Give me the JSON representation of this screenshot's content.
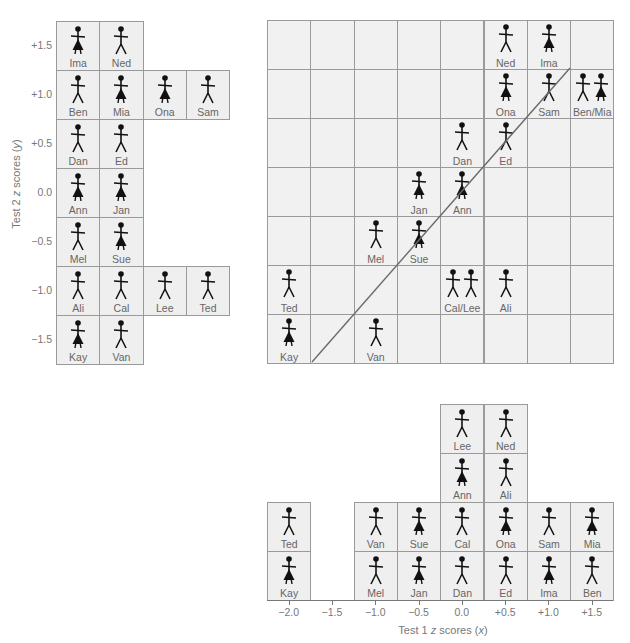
{
  "figure_shapes": {
    "male": "stick-figure-male",
    "female": "stick-figure-female-skirt"
  },
  "people": {
    "Ima": {
      "sex": "F",
      "x": 1.0,
      "y": 1.5
    },
    "Ned": {
      "sex": "M",
      "x": 0.5,
      "y": 1.5
    },
    "Ben": {
      "sex": "M",
      "x": 1.5,
      "y": 1.0
    },
    "Mia": {
      "sex": "F",
      "x": 1.5,
      "y": 1.0
    },
    "Ona": {
      "sex": "F",
      "x": 0.5,
      "y": 1.0
    },
    "Sam": {
      "sex": "M",
      "x": 1.0,
      "y": 1.0
    },
    "Dan": {
      "sex": "M",
      "x": 0.0,
      "y": 0.5
    },
    "Ed": {
      "sex": "M",
      "x": 0.5,
      "y": 0.5
    },
    "Ann": {
      "sex": "F",
      "x": 0.0,
      "y": 0.0
    },
    "Jan": {
      "sex": "F",
      "x": -0.5,
      "y": 0.0
    },
    "Mel": {
      "sex": "M",
      "x": -1.0,
      "y": -0.5
    },
    "Sue": {
      "sex": "F",
      "x": -0.5,
      "y": -0.5
    },
    "Ali": {
      "sex": "M",
      "x": 0.5,
      "y": -1.0
    },
    "Cal": {
      "sex": "M",
      "x": 0.0,
      "y": -1.0
    },
    "Lee": {
      "sex": "M",
      "x": 0.0,
      "y": -1.0
    },
    "Ted": {
      "sex": "M",
      "x": -2.0,
      "y": -1.0
    },
    "Kay": {
      "sex": "F",
      "x": -2.0,
      "y": -1.5
    },
    "Van": {
      "sex": "M",
      "x": -1.0,
      "y": -1.5
    }
  },
  "chart_data": [
    {
      "type": "histogram-pictograph",
      "title": "",
      "orientation": "horizontal",
      "ylabel": "Test 2 z scores (y)",
      "categories": [
        "+1.5",
        "+1.0",
        "+0.5",
        "0.0",
        "-0.5",
        "-1.0",
        "-1.5"
      ],
      "rows": [
        {
          "y": "+1.5",
          "names": [
            "Ima",
            "Ned"
          ]
        },
        {
          "y": "+1.0",
          "names": [
            "Ben",
            "Mia",
            "Ona",
            "Sam"
          ]
        },
        {
          "y": "+0.5",
          "names": [
            "Dan",
            "Ed"
          ]
        },
        {
          "y": "0.0",
          "names": [
            "Ann",
            "Jan"
          ]
        },
        {
          "y": "-0.5",
          "names": [
            "Mel",
            "Sue"
          ]
        },
        {
          "y": "-1.0",
          "names": [
            "Ali",
            "Cal",
            "Lee",
            "Ted"
          ]
        },
        {
          "y": "-1.5",
          "names": [
            "Kay",
            "Van"
          ]
        }
      ],
      "values": [
        2,
        4,
        2,
        2,
        2,
        4,
        2
      ]
    },
    {
      "type": "scatter",
      "title": "",
      "xlabel": "Test 1 z scores (x)",
      "ylabel": "Test 2 z scores (y)",
      "xlim": [
        -2.0,
        1.5
      ],
      "ylim": [
        -1.5,
        1.5
      ],
      "grid": true,
      "points": [
        {
          "label": "Ned",
          "x": 0.5,
          "y": 1.5
        },
        {
          "label": "Ima",
          "x": 1.0,
          "y": 1.5
        },
        {
          "label": "Ona",
          "x": 0.5,
          "y": 1.0
        },
        {
          "label": "Sam",
          "x": 1.0,
          "y": 1.0
        },
        {
          "label": "Ben/Mia",
          "x": 1.5,
          "y": 1.0,
          "count": 2
        },
        {
          "label": "Dan",
          "x": 0.0,
          "y": 0.5
        },
        {
          "label": "Ed",
          "x": 0.5,
          "y": 0.5
        },
        {
          "label": "Jan",
          "x": -0.5,
          "y": 0.0
        },
        {
          "label": "Ann",
          "x": 0.0,
          "y": 0.0
        },
        {
          "label": "Mel",
          "x": -1.0,
          "y": -0.5
        },
        {
          "label": "Sue",
          "x": -0.5,
          "y": -0.5
        },
        {
          "label": "Ted",
          "x": -2.0,
          "y": -1.0
        },
        {
          "label": "Cal/Lee",
          "x": 0.0,
          "y": -1.0,
          "count": 2
        },
        {
          "label": "Ali",
          "x": 0.5,
          "y": -1.0
        },
        {
          "label": "Kay",
          "x": -2.0,
          "y": -1.5
        },
        {
          "label": "Van",
          "x": -1.0,
          "y": -1.5
        }
      ],
      "annotations": [
        "diagonal line y = x"
      ]
    },
    {
      "type": "histogram-pictograph",
      "title": "",
      "orientation": "vertical",
      "xlabel": "Test 1 z scores (x)",
      "categories": [
        "-2.0",
        "-1.5",
        "-1.0",
        "-0.5",
        "0.0",
        "+0.5",
        "+1.0",
        "+1.5"
      ],
      "columns": [
        {
          "x": "-2.0",
          "names": [
            "Kay",
            "Ted"
          ]
        },
        {
          "x": "-1.5",
          "names": []
        },
        {
          "x": "-1.0",
          "names": [
            "Mel",
            "Van"
          ]
        },
        {
          "x": "-0.5",
          "names": [
            "Jan",
            "Sue"
          ]
        },
        {
          "x": "0.0",
          "names": [
            "Dan",
            "Cal",
            "Ann",
            "Lee"
          ]
        },
        {
          "x": "+0.5",
          "names": [
            "Ed",
            "Ona",
            "Ali",
            "Ned"
          ]
        },
        {
          "x": "+1.0",
          "names": [
            "Ima",
            "Sam"
          ]
        },
        {
          "x": "+1.5",
          "names": [
            "Ben",
            "Mia"
          ]
        }
      ],
      "values": [
        2,
        0,
        2,
        2,
        4,
        4,
        2,
        2
      ]
    }
  ],
  "labels": {
    "y_axis_title_prefix": "Test 2 ",
    "y_axis_title_z": "z",
    "y_axis_title_suffix": " scores (",
    "y_axis_title_var": "y",
    "y_axis_title_end": ")",
    "x_axis_title_prefix": "Test 1 ",
    "x_axis_title_z": "z",
    "x_axis_title_suffix": " scores (",
    "x_axis_title_var": "x",
    "x_axis_title_end": ")"
  },
  "y_ticks": [
    "+1.5",
    "+1.0",
    "+0.5",
    "0.0",
    "−0.5",
    "−1.0",
    "−1.5"
  ],
  "x_ticks": [
    "−2.0",
    "−1.5",
    "−1.0",
    "−0.5",
    "0.0",
    "+0.5",
    "+1.0",
    "+1.5"
  ]
}
